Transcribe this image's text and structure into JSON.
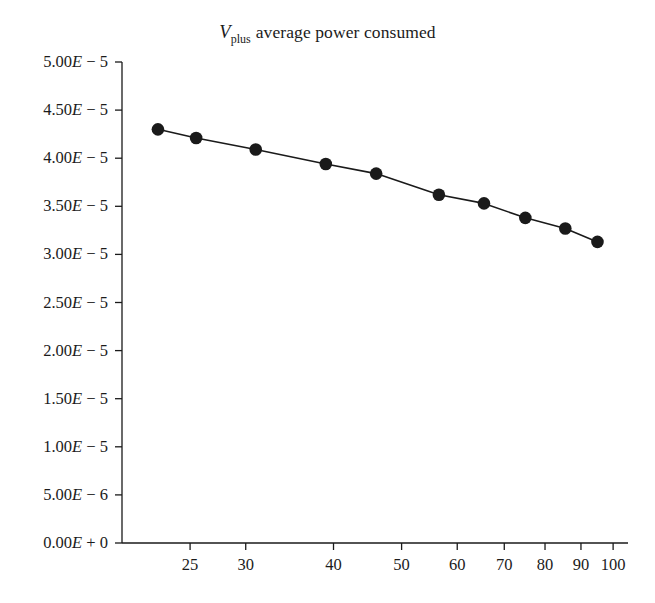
{
  "chart_data": {
    "type": "line",
    "title_parts": {
      "variable": "V",
      "subscript": "plus",
      "rest": "average power consumed"
    },
    "xlabel": "",
    "ylabel": "",
    "xscale": "log",
    "yscale": "linear",
    "xlim": [
      20,
      105
    ],
    "ylim": [
      0,
      5e-05
    ],
    "grid": false,
    "legend": null,
    "marker": "filled-circle",
    "marker_color": "#1a1a1a",
    "line_color": "#1a1a1a",
    "x": [
      22.5,
      25.5,
      31,
      39,
      46,
      56.5,
      65.5,
      75,
      85.5,
      95
    ],
    "values": [
      4.3e-05,
      4.21e-05,
      4.09e-05,
      3.94e-05,
      3.84e-05,
      3.62e-05,
      3.53e-05,
      3.38e-05,
      3.27e-05,
      3.13e-05
    ],
    "series": [
      {
        "name": "Vplus average power consumed",
        "x": [
          22.5,
          25.5,
          31,
          39,
          46,
          56.5,
          65.5,
          75,
          85.5,
          95
        ],
        "values": [
          4.3e-05,
          4.21e-05,
          4.09e-05,
          3.94e-05,
          3.84e-05,
          3.62e-05,
          3.53e-05,
          3.38e-05,
          3.27e-05,
          3.13e-05
        ]
      }
    ],
    "yticks": [
      0,
      5e-06,
      1e-05,
      1.5e-05,
      2e-05,
      2.5e-05,
      3e-05,
      3.5e-05,
      4e-05,
      4.5e-05,
      5e-05
    ],
    "ytick_labels": [
      "0.00E + 0",
      "5.00E − 6",
      "1.00E − 5",
      "1.50E − 5",
      "2.00E − 5",
      "2.50E − 5",
      "3.00E − 5",
      "3.50E − 5",
      "4.00E − 5",
      "4.50E − 5",
      "5.00E − 5"
    ],
    "ytick_label_parts": [
      {
        "mantissa": "0.00",
        "e": "E",
        "exp": " + 0"
      },
      {
        "mantissa": "5.00",
        "e": "E",
        "exp": " − 6"
      },
      {
        "mantissa": "1.00",
        "e": "E",
        "exp": " − 5"
      },
      {
        "mantissa": "1.50",
        "e": "E",
        "exp": " − 5"
      },
      {
        "mantissa": "2.00",
        "e": "E",
        "exp": " − 5"
      },
      {
        "mantissa": "2.50",
        "e": "E",
        "exp": " − 5"
      },
      {
        "mantissa": "3.00",
        "e": "E",
        "exp": " − 5"
      },
      {
        "mantissa": "3.50",
        "e": "E",
        "exp": " − 5"
      },
      {
        "mantissa": "4.00",
        "e": "E",
        "exp": " − 5"
      },
      {
        "mantissa": "4.50",
        "e": "E",
        "exp": " − 5"
      },
      {
        "mantissa": "5.00",
        "e": "E",
        "exp": " − 5"
      }
    ],
    "xticks": [
      25,
      30,
      40,
      50,
      60,
      70,
      80,
      90,
      100
    ],
    "xtick_labels": [
      "25",
      "30",
      "40",
      "50",
      "60",
      "70",
      "80",
      "90",
      "100"
    ]
  },
  "style": {
    "background": "#ffffff",
    "axis_color": "#1a1a1a",
    "text_color": "#1b1b1b"
  }
}
